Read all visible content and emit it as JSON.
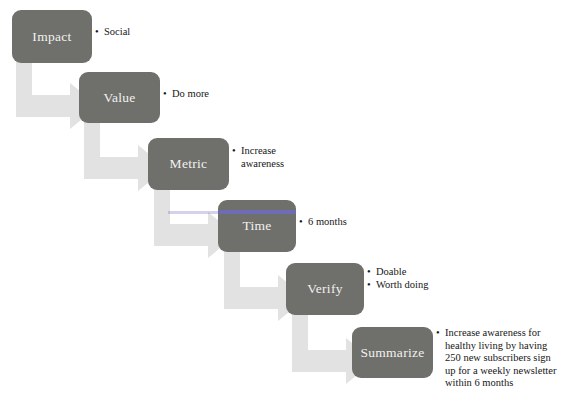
{
  "diagram": {
    "colors": {
      "box_fill": "#6f6f6b",
      "box_text": "#f2f2ef",
      "arrow_fill": "#e2e2e2",
      "background": "#ffffff",
      "text": "#161616",
      "scan_streak": "#6f6bbd"
    },
    "steps": [
      {
        "id": "impact",
        "label": "Impact",
        "bullets": [
          "Social"
        ]
      },
      {
        "id": "value",
        "label": "Value",
        "bullets": [
          "Do more"
        ]
      },
      {
        "id": "metric",
        "label": "Metric",
        "bullets": [
          "Increase awareness"
        ]
      },
      {
        "id": "time",
        "label": "Time",
        "bullets": [
          "6 months"
        ]
      },
      {
        "id": "verify",
        "label": "Verify",
        "bullets": [
          "Doable",
          "Worth doing"
        ]
      },
      {
        "id": "summarize",
        "label": "Summarize",
        "bullets": [
          "Increase awareness for healthy living by having 250 new subscribers sign up for a weekly newsletter within 6 months"
        ]
      }
    ],
    "connectors": [
      {
        "id": "impact-to-value",
        "from": "impact",
        "to": "value"
      },
      {
        "id": "value-to-metric",
        "from": "value",
        "to": "metric"
      },
      {
        "id": "metric-to-time",
        "from": "metric",
        "to": "time"
      },
      {
        "id": "time-to-verify",
        "from": "time",
        "to": "verify"
      },
      {
        "id": "verify-to-summarize",
        "from": "verify",
        "to": "summarize"
      }
    ]
  }
}
